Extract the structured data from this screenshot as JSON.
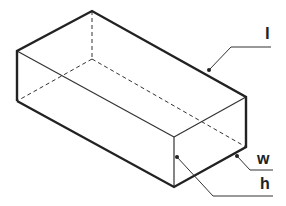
{
  "diagram": {
    "type": "rectangular-prism-isometric",
    "stroke_color": "#222222",
    "labels": {
      "length": "l",
      "width": "w",
      "height": "h"
    }
  }
}
